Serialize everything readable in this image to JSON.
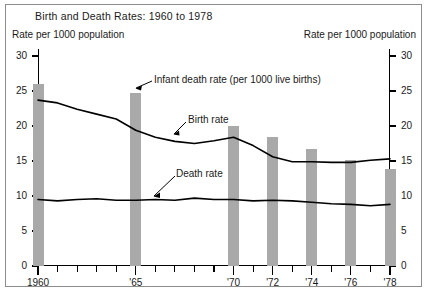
{
  "figure": {
    "title": "Birth and Death Rates: 1960 to 1978",
    "left_axis_caption": "Rate per 1000 population",
    "right_axis_caption": "Rate per 1000 population",
    "bar_color": "#a9a9a9",
    "line_color": "#000000",
    "frame_color": "#8d8d8d",
    "background": "#ffffff"
  },
  "annotations": {
    "infant": "Infant death rate (per 1000 live births)",
    "birth": "Birth rate",
    "death": "Death rate"
  },
  "axis": {
    "y_ticks": [
      "0",
      "5",
      "10",
      "15",
      "20",
      "25",
      "30"
    ],
    "x_labels": [
      "1960",
      "'65",
      "'70",
      "'72",
      "'74",
      "'76",
      "'78"
    ]
  },
  "chart_data": {
    "type": "bar",
    "title": "Birth and Death Rates: 1960 to 1978",
    "xlabel": "",
    "ylabel": "Rate per 1000 population",
    "ylim": [
      0,
      30
    ],
    "ytick_step": 5,
    "xlim": [
      1960,
      1978
    ],
    "grid": false,
    "legend": "inline annotations",
    "bar_series": {
      "name": "Infant death rate (per 1000 live births)",
      "color": "#a9a9a9",
      "x": [
        1960,
        1965,
        1970,
        1972,
        1974,
        1976,
        1978
      ],
      "values": [
        26.0,
        24.7,
        20.0,
        18.5,
        16.7,
        15.2,
        13.8
      ]
    },
    "series": [
      {
        "name": "Birth rate",
        "type": "line",
        "color": "#000000",
        "x": [
          1960,
          1961,
          1962,
          1963,
          1964,
          1965,
          1966,
          1967,
          1968,
          1969,
          1970,
          1971,
          1972,
          1973,
          1974,
          1975,
          1976,
          1977,
          1978
        ],
        "values": [
          23.7,
          23.3,
          22.4,
          21.7,
          21.0,
          19.4,
          18.4,
          17.8,
          17.5,
          17.9,
          18.4,
          17.2,
          15.6,
          14.9,
          14.9,
          14.8,
          14.8,
          15.1,
          15.3
        ]
      },
      {
        "name": "Death rate",
        "type": "line",
        "color": "#000000",
        "x": [
          1960,
          1961,
          1962,
          1963,
          1964,
          1965,
          1966,
          1967,
          1968,
          1969,
          1970,
          1971,
          1972,
          1973,
          1974,
          1975,
          1976,
          1977,
          1978
        ],
        "values": [
          9.5,
          9.3,
          9.5,
          9.6,
          9.4,
          9.4,
          9.5,
          9.4,
          9.7,
          9.5,
          9.5,
          9.3,
          9.4,
          9.3,
          9.1,
          8.9,
          8.8,
          8.6,
          8.8
        ]
      }
    ],
    "x_tick_years": [
      1960,
      1961,
      1962,
      1963,
      1964,
      1965,
      1966,
      1967,
      1968,
      1969,
      1970,
      1971,
      1972,
      1973,
      1974,
      1975,
      1976,
      1977,
      1978
    ],
    "x_labeled_years": [
      1960,
      1965,
      1970,
      1972,
      1974,
      1976,
      1978
    ]
  }
}
